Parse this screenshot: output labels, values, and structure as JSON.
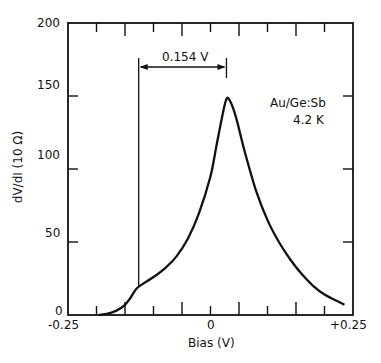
{
  "chart_data": {
    "type": "line",
    "title": "",
    "xlabel": "Bias (V)",
    "ylabel": "dV/dI (10 Ω)",
    "xlim": [
      -0.25,
      0.25
    ],
    "ylim": [
      0,
      200
    ],
    "x_tick_labels": [
      "-0.25",
      "0",
      "+0.25"
    ],
    "y_tick_labels": [
      "0",
      "50",
      "100",
      "150",
      "200"
    ],
    "grid": false,
    "annotations": [
      "0.154 V",
      "Au/Ge:Sb",
      "4.2 K"
    ],
    "series": [
      {
        "name": "Au/Ge:Sb 4.2 K",
        "x": [
          -0.195,
          -0.18,
          -0.165,
          -0.15,
          -0.14,
          -0.13,
          -0.12,
          -0.1,
          -0.08,
          -0.06,
          -0.04,
          -0.02,
          0.0,
          0.01,
          0.02,
          0.028,
          0.035,
          0.045,
          0.06,
          0.08,
          0.1,
          0.12,
          0.14,
          0.16,
          0.18,
          0.2,
          0.22,
          0.235
        ],
        "values": [
          0,
          1,
          3,
          7,
          12,
          18,
          21,
          26,
          32,
          40,
          52,
          70,
          95,
          115,
          135,
          148,
          146,
          135,
          112,
          85,
          65,
          50,
          38,
          28,
          20,
          14,
          10,
          7
        ]
      }
    ]
  },
  "axis": {
    "y_label": "dV/dI (10 Ω)",
    "x_label": "Bias (V)"
  },
  "annotation": {
    "span": "0.154 V",
    "sample": "Au/Ge:Sb",
    "temp": "4.2 K"
  }
}
